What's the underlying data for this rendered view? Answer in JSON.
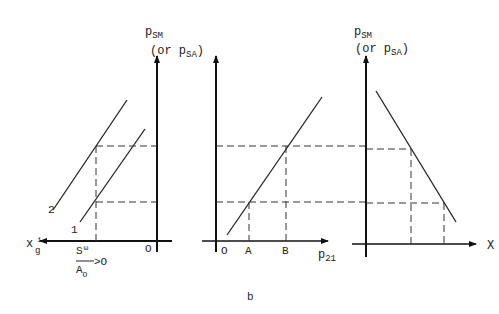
{
  "figure": {
    "caption": "b",
    "panels": [
      {
        "id": "left",
        "y_axis": {
          "label": "p",
          "sub": "SM",
          "alt_open": "(or p",
          "alt_sub": "SA",
          "alt_close": ")"
        },
        "x_axis": {
          "label": "x",
          "sub": "g",
          "sup": "i"
        },
        "origin_label": "O",
        "curves": [
          {
            "label": "1"
          },
          {
            "label": "2"
          }
        ],
        "annotation": {
          "num": "S",
          "num_sub": "ω",
          "den": "A",
          "den_sub": "O",
          "relation": ">O"
        }
      },
      {
        "id": "middle",
        "x_axis": {
          "label": "p",
          "sub": "21"
        },
        "origin_label": "O",
        "tick_labels": [
          "A",
          "B"
        ]
      },
      {
        "id": "right",
        "y_axis": {
          "label": "p",
          "sub": "SM",
          "alt_open": "(or p",
          "alt_sub": "SA",
          "alt_close": ")"
        },
        "x_axis": {
          "label": "X"
        }
      }
    ]
  }
}
